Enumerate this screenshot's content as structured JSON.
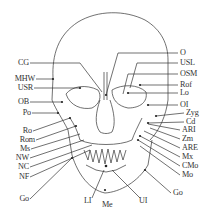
{
  "figure": {
    "type": "frontal cephalometric skull landmark diagram",
    "caption": "",
    "left_labels": [
      {
        "id": "CG",
        "x": 21,
        "y": 60
      },
      {
        "id": "MHW",
        "x": 10,
        "y": 76
      },
      {
        "id": "USR",
        "x": 15,
        "y": 85
      },
      {
        "id": "OB",
        "x": 21,
        "y": 99
      },
      {
        "id": "Po",
        "x": 23,
        "y": 110
      },
      {
        "id": "Ro",
        "x": 23,
        "y": 128
      },
      {
        "id": "Rom",
        "x": 15,
        "y": 137
      },
      {
        "id": "Ms",
        "x": 20,
        "y": 146
      },
      {
        "id": "NW",
        "x": 18,
        "y": 155
      },
      {
        "id": "NC",
        "x": 20,
        "y": 164
      },
      {
        "id": "NF",
        "x": 19,
        "y": 174
      },
      {
        "id": "Go",
        "x": 20,
        "y": 196
      }
    ],
    "right_labels": [
      {
        "id": "O",
        "x": 180,
        "y": 50
      },
      {
        "id": "USL",
        "x": 180,
        "y": 60
      },
      {
        "id": "OSM",
        "x": 180,
        "y": 71
      },
      {
        "id": "Rof",
        "x": 180,
        "y": 82
      },
      {
        "id": "Lo",
        "x": 180,
        "y": 90
      },
      {
        "id": "OI",
        "x": 180,
        "y": 102
      },
      {
        "id": "Zyg",
        "x": 186,
        "y": 110
      },
      {
        "id": "Cd",
        "x": 186,
        "y": 119
      },
      {
        "id": "ARI",
        "x": 182,
        "y": 127
      },
      {
        "id": "Zm",
        "x": 182,
        "y": 136
      },
      {
        "id": "ARE",
        "x": 182,
        "y": 145
      },
      {
        "id": "Mx",
        "x": 182,
        "y": 154
      },
      {
        "id": "CMo",
        "x": 182,
        "y": 163
      },
      {
        "id": "Mo",
        "x": 182,
        "y": 172
      },
      {
        "id": "Go",
        "x": 173,
        "y": 190
      }
    ],
    "bottom_labels": [
      {
        "id": "LI",
        "x": 85,
        "y": 198
      },
      {
        "id": "Me",
        "x": 103,
        "y": 202
      },
      {
        "id": "UI",
        "x": 140,
        "y": 198
      }
    ],
    "colors": {
      "line": "#333333",
      "text": "#333333",
      "background": "#ffffff"
    }
  }
}
